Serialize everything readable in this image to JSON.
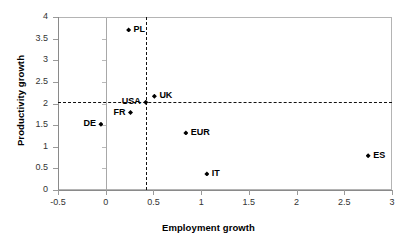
{
  "chart_data": {
    "type": "scatter",
    "title": "",
    "xlabel": "Employment growth",
    "ylabel": "Productivity growth",
    "xlim": [
      -0.5,
      3
    ],
    "ylim": [
      0,
      4
    ],
    "xticks": [
      "-0.5",
      "0",
      "0.5",
      "1",
      "1.5",
      "2",
      "2.5",
      "3"
    ],
    "xtick_values": [
      -0.5,
      0,
      0.5,
      1,
      1.5,
      2,
      2.5,
      3
    ],
    "yticks": [
      "0",
      "0.5",
      "1",
      "1.5",
      "2",
      "2.5",
      "3",
      "3.5",
      "4"
    ],
    "ytick_values": [
      0,
      0.5,
      1,
      1.5,
      2,
      2.5,
      3,
      3.5,
      4
    ],
    "grid": false,
    "legend": false,
    "marker": "diamond",
    "marker_color": "#000000",
    "reference_lines": [
      {
        "orientation": "horizontal",
        "value": 2.03,
        "style": "dashed",
        "color": "#111111"
      },
      {
        "orientation": "vertical",
        "value": 0.42,
        "style": "dashed",
        "color": "#111111"
      },
      {
        "orientation": "vertical",
        "value": 0,
        "style": "solid",
        "color": "#a8a8a8"
      }
    ],
    "points": [
      {
        "label": "PL",
        "x": 0.24,
        "y": 3.7,
        "label_side": "right"
      },
      {
        "label": "USA",
        "x": 0.42,
        "y": 2.03,
        "label_side": "left"
      },
      {
        "label": "UK",
        "x": 0.51,
        "y": 2.17,
        "label_side": "right"
      },
      {
        "label": "FR",
        "x": 0.26,
        "y": 1.79,
        "label_side": "left"
      },
      {
        "label": "DE",
        "x": -0.05,
        "y": 1.52,
        "label_side": "left"
      },
      {
        "label": "EUR",
        "x": 0.84,
        "y": 1.32,
        "label_side": "right"
      },
      {
        "label": "ES",
        "x": 2.75,
        "y": 0.79,
        "label_side": "right"
      },
      {
        "label": "IT",
        "x": 1.06,
        "y": 0.37,
        "label_side": "right"
      }
    ]
  }
}
